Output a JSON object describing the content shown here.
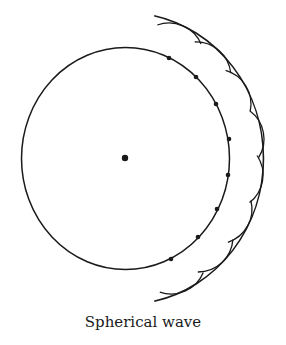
{
  "figure": {
    "caption": "Spherical wave",
    "stroke_color": "#1a1a1a",
    "source": {
      "cx": 125,
      "cy": 158,
      "r": 3.2
    },
    "primary_wavefront": {
      "cx": 125.5,
      "cy": 158.5,
      "rx": 104,
      "ry": 111
    },
    "secondary_sources": [
      {
        "x": 169,
        "y": 58
      },
      {
        "x": 196,
        "y": 77
      },
      {
        "x": 216,
        "y": 104
      },
      {
        "x": 229,
        "y": 139
      },
      {
        "x": 228,
        "y": 175
      },
      {
        "x": 217,
        "y": 209
      },
      {
        "x": 198,
        "y": 237
      },
      {
        "x": 171,
        "y": 259
      }
    ],
    "wavelet_radius": 35,
    "envelope": {
      "cx": 125.5,
      "cy": 158.5,
      "rx": 138,
      "ry": 146,
      "start_deg": -78,
      "end_deg": 78
    }
  }
}
